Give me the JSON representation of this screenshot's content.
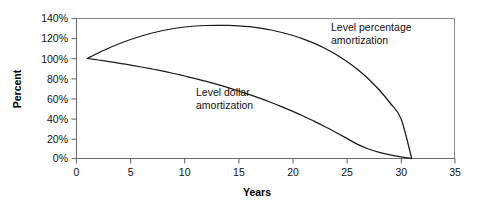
{
  "chart_data": {
    "type": "line",
    "title": "",
    "subtitle": "",
    "xlabel": "Years",
    "ylabel": "Percent",
    "xlim": [
      0,
      35
    ],
    "ylim": [
      0,
      140
    ],
    "xticks": [
      "0",
      "5",
      "10",
      "15",
      "20",
      "25",
      "30",
      "35"
    ],
    "xtick_values": [
      0,
      5,
      10,
      15,
      20,
      25,
      30,
      35
    ],
    "yticks": [
      "0%",
      "20%",
      "40%",
      "60%",
      "80%",
      "100%",
      "120%",
      "140%"
    ],
    "ytick_values": [
      0,
      20,
      40,
      60,
      80,
      100,
      120,
      140
    ],
    "grid": false,
    "legend": "none",
    "annotations": [
      {
        "name": "level-percentage-annotation",
        "line1": "Level percentage",
        "line2": "amortization",
        "x": 331,
        "y": 31
      },
      {
        "name": "level-dollar-annotation",
        "line1": "Level dollar",
        "line2": "amortization",
        "x": 196,
        "y": 96
      }
    ],
    "series": [
      {
        "name": "Level percentage amortization",
        "color": "#1a1a1a",
        "x": [
          1,
          2,
          3,
          4,
          5,
          6,
          7,
          8,
          9,
          10,
          11,
          12,
          13,
          14,
          15,
          16,
          17,
          18,
          19,
          20,
          21,
          22,
          23,
          24,
          25,
          26,
          27,
          28,
          29,
          30,
          31
        ],
        "values": [
          100,
          105.5,
          110.5,
          115,
          119,
          122.5,
          125.5,
          128,
          130,
          131.5,
          132.5,
          133,
          133.2,
          133.1,
          132.7,
          131.8,
          130.4,
          128.5,
          126,
          123,
          119.4,
          115.1,
          110,
          104,
          97,
          89,
          79.5,
          68.5,
          55.5,
          40,
          0
        ]
      },
      {
        "name": "Level dollar amortization",
        "color": "#1a1a1a",
        "x": [
          1,
          2,
          3,
          4,
          5,
          6,
          7,
          8,
          9,
          10,
          11,
          12,
          13,
          14,
          15,
          16,
          17,
          18,
          19,
          20,
          21,
          22,
          23,
          24,
          25,
          26,
          27,
          28,
          29,
          30,
          31
        ],
        "values": [
          100,
          98.5,
          96.9,
          95.2,
          93.4,
          91.5,
          89.5,
          87.3,
          85,
          82.5,
          79.9,
          77.1,
          74.1,
          70.9,
          67.5,
          63.9,
          60.1,
          56,
          51.7,
          47.1,
          42.2,
          37.1,
          31.7,
          26,
          20.1,
          14.1,
          9.5,
          6.2,
          3.6,
          1.6,
          0
        ]
      }
    ]
  },
  "axes": {
    "y_title": "Percent",
    "x_title": "Years"
  }
}
